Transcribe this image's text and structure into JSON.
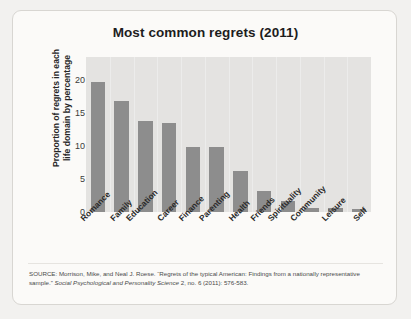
{
  "chart_data": {
    "type": "bar",
    "title": "Most common regrets (2011)",
    "xlabel": "",
    "ylabel": "Proportion of regrets in each life domain by percentage",
    "ylabel_line1": "Proportion of regrets in each",
    "ylabel_line2": "life domain by percentage",
    "categories": [
      "Romance",
      "Family",
      "Education",
      "Career",
      "Finance",
      "Parenting",
      "Health",
      "Friends",
      "Spirituality",
      "Community",
      "Leisure",
      "Self"
    ],
    "values": [
      19.7,
      16.9,
      13.8,
      13.5,
      9.8,
      9.8,
      6.2,
      3.2,
      1.6,
      0.6,
      0.6,
      0.5
    ],
    "yticks": [
      0,
      5,
      10,
      15,
      20
    ],
    "ylim": [
      0,
      23.5
    ],
    "grid": "vertical",
    "legend": "none",
    "bar_color": "#8d8d8d",
    "plot_background": "#e4e3e1"
  },
  "source": {
    "line1": "SOURCE: Morrison, Mike, and Neal J. Roese. “Regrets of the typical American: Findings from a nationally representative",
    "line2_prefix": "sample.” ",
    "line2_italic": "Social Psychological and Personality Science",
    "line2_suffix": " 2, no. 6 (2011): 576-583."
  }
}
